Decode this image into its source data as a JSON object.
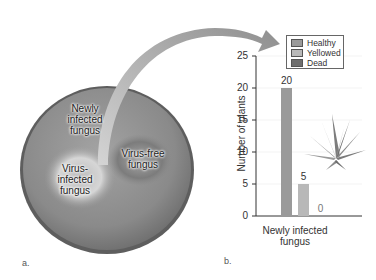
{
  "panels": {
    "a": {
      "label": "a.",
      "dish_labels": {
        "newly_infected": "Newly infected fungus",
        "newly_infected_lines": [
          "Newly",
          "infected",
          "fungus"
        ],
        "virus_infected_lines": [
          "Virus-",
          "infected",
          "fungus"
        ],
        "virus_free_lines": [
          "Virus-free",
          "fungus"
        ]
      }
    },
    "b": {
      "label": "b."
    }
  },
  "colors": {
    "healthy": "#9a9a9a",
    "yellowed": "#b8b8b8",
    "dead": "#6e6e6e",
    "dish": "#8c8c8c",
    "arrow": "#a8a8a8"
  },
  "chart_data": {
    "type": "bar",
    "title": "",
    "categories": [
      "Newly infected fungus"
    ],
    "xlabel_lines": [
      "Newly infected",
      "fungus"
    ],
    "ylabel": "Number of plants",
    "ylim": [
      0,
      25
    ],
    "yticks": [
      0,
      5,
      10,
      15,
      20,
      25
    ],
    "series": [
      {
        "name": "Healthy",
        "values": [
          20
        ]
      },
      {
        "name": "Yellowed",
        "values": [
          5
        ]
      },
      {
        "name": "Dead",
        "values": [
          0
        ]
      }
    ],
    "legend": {
      "position": "top-right",
      "entries": [
        "Healthy",
        "Yellowed",
        "Dead"
      ]
    },
    "grid": true
  }
}
